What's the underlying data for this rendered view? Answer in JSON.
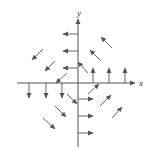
{
  "diagram": {
    "type": "vector-field",
    "stroke_color": "#555555",
    "axes": {
      "x_label": "x",
      "y_label": "y",
      "origin": [
        78,
        83
      ],
      "x_axis": {
        "from": [
          17,
          83
        ],
        "to": [
          135,
          83
        ],
        "label_pos": [
          139,
          86
        ]
      },
      "y_axis": {
        "from": [
          78,
          147
        ],
        "to": [
          78,
          19
        ],
        "label_pos": [
          77,
          16
        ]
      }
    },
    "vectors": [
      {
        "id": "left-1",
        "from": [
          78,
          34
        ],
        "to": [
          63,
          34
        ]
      },
      {
        "id": "left-2",
        "from": [
          78,
          51
        ],
        "to": [
          63,
          51
        ]
      },
      {
        "id": "left-3",
        "from": [
          78,
          68
        ],
        "to": [
          63,
          68
        ]
      },
      {
        "id": "up-1",
        "from": [
          93,
          83
        ],
        "to": [
          93,
          68
        ]
      },
      {
        "id": "up-2",
        "from": [
          109,
          83
        ],
        "to": [
          109,
          68
        ]
      },
      {
        "id": "up-3",
        "from": [
          125,
          83
        ],
        "to": [
          125,
          68
        ]
      },
      {
        "id": "down-1",
        "from": [
          29,
          83
        ],
        "to": [
          29,
          98
        ]
      },
      {
        "id": "down-2",
        "from": [
          46,
          83
        ],
        "to": [
          46,
          98
        ]
      },
      {
        "id": "down-3",
        "from": [
          62,
          83
        ],
        "to": [
          62,
          98
        ]
      },
      {
        "id": "right-1",
        "from": [
          78,
          99
        ],
        "to": [
          93,
          99
        ]
      },
      {
        "id": "right-2",
        "from": [
          78,
          116
        ],
        "to": [
          93,
          116
        ]
      },
      {
        "id": "right-3",
        "from": [
          78,
          133
        ],
        "to": [
          93,
          133
        ]
      },
      {
        "id": "diag-nw-1",
        "from": [
          112,
          48
        ],
        "to": [
          101,
          37
        ]
      },
      {
        "id": "diag-nw-2",
        "from": [
          101,
          61
        ],
        "to": [
          90,
          50
        ]
      },
      {
        "id": "diag-nw-3",
        "from": [
          88,
          73
        ],
        "to": [
          78,
          62
        ]
      },
      {
        "id": "diag-sw-1",
        "from": [
          43,
          49
        ],
        "to": [
          32,
          60
        ]
      },
      {
        "id": "diag-sw-2",
        "from": [
          55,
          61
        ],
        "to": [
          45,
          71
        ]
      },
      {
        "id": "diag-sw-3",
        "from": [
          67,
          73
        ],
        "to": [
          56,
          83
        ]
      },
      {
        "id": "diag-se-1",
        "from": [
          67,
          94
        ],
        "to": [
          77,
          104
        ]
      },
      {
        "id": "diag-se-2",
        "from": [
          55,
          106
        ],
        "to": [
          66,
          117
        ]
      },
      {
        "id": "diag-se-3",
        "from": [
          43,
          118
        ],
        "to": [
          55,
          129
        ]
      },
      {
        "id": "diag-ne-1",
        "from": [
          88,
          94
        ],
        "to": [
          99,
          84
        ]
      },
      {
        "id": "diag-ne-2",
        "from": [
          100,
          106
        ],
        "to": [
          111,
          95
        ]
      },
      {
        "id": "diag-ne-3",
        "from": [
          112,
          118
        ],
        "to": [
          122,
          107
        ]
      }
    ]
  }
}
